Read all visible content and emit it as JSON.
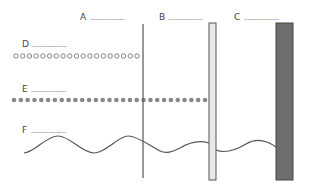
{
  "labels": {
    "A": "A",
    "B": "B",
    "C": "C",
    "D": "D",
    "E": "E",
    "F": "F",
    "blank": "...................."
  },
  "elements": {
    "A": {
      "kind": "thin-line",
      "color": "#555555"
    },
    "B": {
      "kind": "light-bar",
      "fill": "#e8e8e8",
      "stroke": "#555555"
    },
    "C": {
      "kind": "dark-bar",
      "fill": "#6e6e6e",
      "stroke": "#444444"
    },
    "D": {
      "kind": "hollow-circle-row",
      "count": 19,
      "color": "#777777"
    },
    "E": {
      "kind": "filled-dot-row",
      "count": 29,
      "color": "#888888"
    },
    "F": {
      "kind": "wave",
      "color": "#555555"
    }
  }
}
